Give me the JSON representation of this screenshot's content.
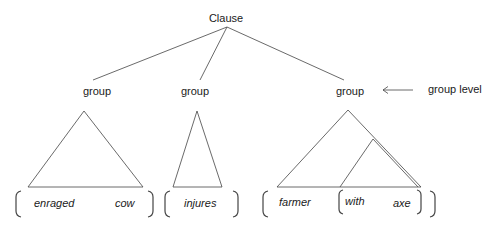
{
  "diagram": {
    "root": "Clause",
    "groups": [
      "group",
      "group",
      "group"
    ],
    "level_label": "group level",
    "words": {
      "g1": [
        "enraged",
        "cow"
      ],
      "g2": [
        "injures"
      ],
      "g3": [
        "farmer",
        "with",
        "axe"
      ]
    }
  }
}
